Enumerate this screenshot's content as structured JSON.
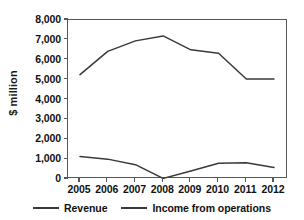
{
  "chart_data": {
    "type": "line",
    "title": "",
    "xlabel": "",
    "ylabel": "$ million",
    "categories": [
      "2005",
      "2006",
      "2007",
      "2008",
      "2009",
      "2010",
      "2011",
      "2012"
    ],
    "x": [
      2005,
      2006,
      2007,
      2008,
      2009,
      2010,
      2011,
      2012
    ],
    "ylim": [
      0,
      8000
    ],
    "ytick_values": [
      0,
      1000,
      2000,
      3000,
      4000,
      5000,
      6000,
      7000,
      8000
    ],
    "ytick_labels": [
      "0",
      "1,000",
      "2,000",
      "3,000",
      "4,000",
      "5,000",
      "6,000",
      "7,000",
      "8,000"
    ],
    "grid": false,
    "legend_position": "bottom",
    "line_color": "#3a3a3a",
    "axis_color": "#55585c",
    "series": [
      {
        "name": "Revenue",
        "values": [
          5250,
          6420,
          6950,
          7200,
          6500,
          6330,
          5030,
          5030
        ]
      },
      {
        "name": "Income from operations",
        "values": [
          1130,
          1000,
          720,
          30,
          400,
          790,
          820,
          580
        ]
      }
    ]
  },
  "legend": {
    "items": [
      {
        "label": "Revenue"
      },
      {
        "label": "Income from operations"
      }
    ]
  }
}
